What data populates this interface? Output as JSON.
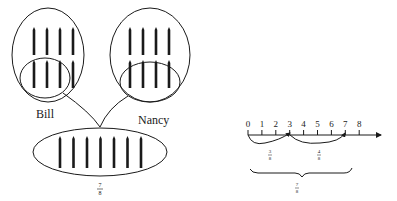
{
  "left_diagram": {
    "groups": [
      {
        "name": "Bill",
        "label": "Bill",
        "total_sticks": 8,
        "selected_sticks": 3
      },
      {
        "name": "Nancy",
        "label": "Nancy",
        "total_sticks": 8,
        "selected_sticks": 4
      }
    ],
    "combined": {
      "sticks": 7,
      "fraction": {
        "numerator": "7",
        "denominator": "8"
      }
    }
  },
  "number_line": {
    "ticks": [
      "0",
      "1",
      "2",
      "3",
      "4",
      "5",
      "6",
      "7",
      "8"
    ],
    "jumps": [
      {
        "from": 0,
        "to": 3,
        "fraction": {
          "numerator": "3",
          "denominator": "8"
        }
      },
      {
        "from": 3,
        "to": 7,
        "fraction": {
          "numerator": "4",
          "denominator": "8"
        }
      }
    ],
    "total": {
      "from": 0,
      "to": 7,
      "fraction": {
        "numerator": "7",
        "denominator": "8"
      }
    }
  },
  "colors": {
    "ink": "#1a1a1a",
    "background": "#ffffff"
  }
}
